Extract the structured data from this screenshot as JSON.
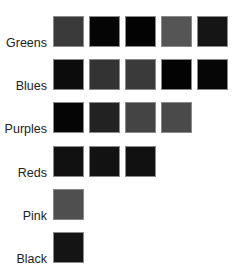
{
  "groups": [
    {
      "label": "Greens",
      "swatches": [
        "#3a3a3a",
        "#050505",
        "#030303",
        "#555555",
        "#151515"
      ]
    },
    {
      "label": "Blues",
      "swatches": [
        "#0c0c0c",
        "#333333",
        "#3a3a3a",
        "#030303",
        "#060606"
      ]
    },
    {
      "label": "Purples",
      "swatches": [
        "#050505",
        "#222222",
        "#444444",
        "#4a4a4a"
      ]
    },
    {
      "label": "Reds",
      "swatches": [
        "#111111",
        "#121212",
        "#111111"
      ]
    },
    {
      "label": "Pink",
      "swatches": [
        "#4f4f4f"
      ]
    },
    {
      "label": "Black",
      "swatches": [
        "#141414"
      ]
    }
  ]
}
